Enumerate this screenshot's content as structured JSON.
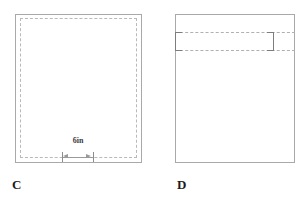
{
  "canvas": {
    "width": 308,
    "height": 200,
    "background_color": "#ffffff"
  },
  "figures": [
    {
      "id": "C",
      "caption": "C",
      "outline_style": "solid",
      "outline_color": "#a9a9a9",
      "inner_outline_style": "dashed",
      "inner_outline_color": "#b9b9b9",
      "dimension": {
        "label": "6in",
        "value": 6,
        "unit": "in",
        "line_color": "#9a9a9a",
        "orientation": "horizontal",
        "position": "bottom"
      }
    },
    {
      "id": "D",
      "caption": "D",
      "outline_style": "solid",
      "outline_color": "#a9a9a9",
      "band": {
        "line_style": "dashed",
        "line_color": "#b0b0b0",
        "bracket_color": "#7d7d7d",
        "position": "top",
        "line_count": 2
      }
    }
  ]
}
